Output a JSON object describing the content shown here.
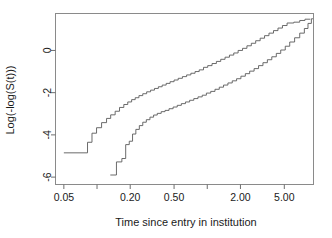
{
  "chart_data": {
    "type": "line",
    "title": "",
    "subtitle": "",
    "xlabel": "Time since entry in institution",
    "ylabel": "Log(-log(S(t)))",
    "xscale": "log",
    "yscale": "linear",
    "grid": false,
    "legend": null,
    "xlim": [
      0.042,
      9.2
    ],
    "ylim": [
      -6.35,
      1.75
    ],
    "x_ticks": [
      0.05,
      0.1,
      0.2,
      0.5,
      1.0,
      2.0,
      5.0
    ],
    "x_tick_labels": [
      "0.05",
      "",
      "0.20",
      "0.50",
      "",
      "2.00",
      "5.00"
    ],
    "x_minor_ticks": [
      0.05,
      0.1,
      0.2,
      0.5,
      1.0,
      2.0,
      5.0
    ],
    "y_ticks": [
      0,
      -2,
      -4,
      -6
    ],
    "y_tick_labels": [
      "0",
      "-2",
      "-4",
      "-6"
    ],
    "series": [
      {
        "name": "upper-curve",
        "style": "step",
        "points": [
          [
            0.05,
            -4.85
          ],
          [
            0.082,
            -4.85
          ],
          [
            0.082,
            -4.35
          ],
          [
            0.09,
            -4.35
          ],
          [
            0.09,
            -3.92
          ],
          [
            0.099,
            -3.92
          ],
          [
            0.099,
            -3.66
          ],
          [
            0.11,
            -3.66
          ],
          [
            0.11,
            -3.42
          ],
          [
            0.122,
            -3.42
          ],
          [
            0.122,
            -3.22
          ],
          [
            0.133,
            -3.22
          ],
          [
            0.133,
            -3.05
          ],
          [
            0.146,
            -3.05
          ],
          [
            0.146,
            -2.88
          ],
          [
            0.16,
            -2.88
          ],
          [
            0.16,
            -2.7
          ],
          [
            0.175,
            -2.7
          ],
          [
            0.175,
            -2.56
          ],
          [
            0.19,
            -2.56
          ],
          [
            0.19,
            -2.44
          ],
          [
            0.206,
            -2.44
          ],
          [
            0.206,
            -2.33
          ],
          [
            0.222,
            -2.33
          ],
          [
            0.222,
            -2.24
          ],
          [
            0.24,
            -2.24
          ],
          [
            0.24,
            -2.14
          ],
          [
            0.26,
            -2.14
          ],
          [
            0.26,
            -2.05
          ],
          [
            0.282,
            -2.05
          ],
          [
            0.282,
            -1.96
          ],
          [
            0.306,
            -1.96
          ],
          [
            0.306,
            -1.88
          ],
          [
            0.332,
            -1.88
          ],
          [
            0.332,
            -1.8
          ],
          [
            0.36,
            -1.8
          ],
          [
            0.36,
            -1.72
          ],
          [
            0.39,
            -1.72
          ],
          [
            0.39,
            -1.64
          ],
          [
            0.424,
            -1.64
          ],
          [
            0.424,
            -1.56
          ],
          [
            0.46,
            -1.56
          ],
          [
            0.46,
            -1.48
          ],
          [
            0.5,
            -1.48
          ],
          [
            0.5,
            -1.4
          ],
          [
            0.545,
            -1.4
          ],
          [
            0.545,
            -1.32
          ],
          [
            0.595,
            -1.32
          ],
          [
            0.595,
            -1.24
          ],
          [
            0.65,
            -1.24
          ],
          [
            0.65,
            -1.16
          ],
          [
            0.71,
            -1.16
          ],
          [
            0.71,
            -1.08
          ],
          [
            0.775,
            -1.08
          ],
          [
            0.775,
            -1.0
          ],
          [
            0.845,
            -1.0
          ],
          [
            0.845,
            -0.92
          ],
          [
            0.925,
            -0.92
          ],
          [
            0.925,
            -0.8
          ],
          [
            1.01,
            -0.8
          ],
          [
            1.01,
            -0.72
          ],
          [
            1.105,
            -0.72
          ],
          [
            1.105,
            -0.62
          ],
          [
            1.21,
            -0.62
          ],
          [
            1.21,
            -0.52
          ],
          [
            1.325,
            -0.52
          ],
          [
            1.325,
            -0.42
          ],
          [
            1.45,
            -0.42
          ],
          [
            1.45,
            -0.32
          ],
          [
            1.59,
            -0.32
          ],
          [
            1.59,
            -0.22
          ],
          [
            1.74,
            -0.22
          ],
          [
            1.74,
            -0.12
          ],
          [
            1.905,
            -0.12
          ],
          [
            1.905,
            0.0
          ],
          [
            2.09,
            0.0
          ],
          [
            2.09,
            0.1
          ],
          [
            2.29,
            0.1
          ],
          [
            2.29,
            0.22
          ],
          [
            2.51,
            0.22
          ],
          [
            2.51,
            0.34
          ],
          [
            2.75,
            0.34
          ],
          [
            2.75,
            0.46
          ],
          [
            3.02,
            0.46
          ],
          [
            3.02,
            0.58
          ],
          [
            3.31,
            0.58
          ],
          [
            3.31,
            0.7
          ],
          [
            3.63,
            0.7
          ],
          [
            3.63,
            0.82
          ],
          [
            3.99,
            0.82
          ],
          [
            3.99,
            0.94
          ],
          [
            4.38,
            0.94
          ],
          [
            4.38,
            1.06
          ],
          [
            4.81,
            1.06
          ],
          [
            4.81,
            1.18
          ],
          [
            5.3,
            1.18
          ],
          [
            5.3,
            1.3
          ],
          [
            6.1,
            1.3
          ],
          [
            6.1,
            1.34
          ],
          [
            6.9,
            1.34
          ],
          [
            6.9,
            1.42
          ],
          [
            7.7,
            1.42
          ],
          [
            7.7,
            1.48
          ],
          [
            8.6,
            1.48
          ]
        ]
      },
      {
        "name": "lower-curve",
        "style": "step",
        "points": [
          [
            0.132,
            -5.9
          ],
          [
            0.15,
            -5.9
          ],
          [
            0.15,
            -5.28
          ],
          [
            0.168,
            -5.28
          ],
          [
            0.168,
            -5.12
          ],
          [
            0.182,
            -5.12
          ],
          [
            0.182,
            -4.46
          ],
          [
            0.196,
            -4.46
          ],
          [
            0.196,
            -4.3
          ],
          [
            0.21,
            -4.3
          ],
          [
            0.21,
            -3.96
          ],
          [
            0.225,
            -3.96
          ],
          [
            0.225,
            -3.74
          ],
          [
            0.242,
            -3.74
          ],
          [
            0.242,
            -3.56
          ],
          [
            0.26,
            -3.56
          ],
          [
            0.26,
            -3.4
          ],
          [
            0.28,
            -3.4
          ],
          [
            0.28,
            -3.28
          ],
          [
            0.302,
            -3.28
          ],
          [
            0.302,
            -3.16
          ],
          [
            0.326,
            -3.16
          ],
          [
            0.326,
            -3.06
          ],
          [
            0.352,
            -3.06
          ],
          [
            0.352,
            -2.98
          ],
          [
            0.382,
            -2.98
          ],
          [
            0.382,
            -2.9
          ],
          [
            0.414,
            -2.9
          ],
          [
            0.414,
            -2.84
          ],
          [
            0.45,
            -2.84
          ],
          [
            0.45,
            -2.76
          ],
          [
            0.49,
            -2.76
          ],
          [
            0.49,
            -2.68
          ],
          [
            0.534,
            -2.68
          ],
          [
            0.534,
            -2.6
          ],
          [
            0.582,
            -2.6
          ],
          [
            0.582,
            -2.52
          ],
          [
            0.634,
            -2.52
          ],
          [
            0.634,
            -2.44
          ],
          [
            0.692,
            -2.44
          ],
          [
            0.692,
            -2.36
          ],
          [
            0.755,
            -2.36
          ],
          [
            0.755,
            -2.28
          ],
          [
            0.824,
            -2.28
          ],
          [
            0.824,
            -2.2
          ],
          [
            0.9,
            -2.2
          ],
          [
            0.9,
            -2.12
          ],
          [
            0.982,
            -2.12
          ],
          [
            0.982,
            -2.02
          ],
          [
            1.075,
            -2.02
          ],
          [
            1.075,
            -1.94
          ],
          [
            1.175,
            -1.94
          ],
          [
            1.175,
            -1.84
          ],
          [
            1.285,
            -1.84
          ],
          [
            1.285,
            -1.74
          ],
          [
            1.405,
            -1.74
          ],
          [
            1.405,
            -1.64
          ],
          [
            1.54,
            -1.64
          ],
          [
            1.54,
            -1.54
          ],
          [
            1.685,
            -1.54
          ],
          [
            1.685,
            -1.44
          ],
          [
            1.845,
            -1.44
          ],
          [
            1.845,
            -1.34
          ],
          [
            2.02,
            -1.34
          ],
          [
            2.02,
            -1.22
          ],
          [
            2.215,
            -1.22
          ],
          [
            2.215,
            -1.1
          ],
          [
            2.425,
            -1.1
          ],
          [
            2.425,
            -0.98
          ],
          [
            2.66,
            -0.98
          ],
          [
            2.66,
            -0.86
          ],
          [
            2.92,
            -0.86
          ],
          [
            2.92,
            -0.72
          ],
          [
            3.2,
            -0.72
          ],
          [
            3.2,
            -0.58
          ],
          [
            3.51,
            -0.58
          ],
          [
            3.51,
            -0.44
          ],
          [
            3.85,
            -0.44
          ],
          [
            3.85,
            -0.3
          ],
          [
            4.23,
            -0.3
          ],
          [
            4.23,
            -0.14
          ],
          [
            4.64,
            -0.14
          ],
          [
            4.64,
            0.02
          ],
          [
            5.1,
            0.02
          ],
          [
            5.1,
            0.2
          ],
          [
            5.6,
            0.2
          ],
          [
            5.6,
            0.4
          ],
          [
            6.2,
            0.4
          ],
          [
            6.2,
            0.6
          ],
          [
            6.9,
            0.6
          ],
          [
            6.9,
            0.82
          ],
          [
            7.6,
            0.82
          ],
          [
            7.6,
            1.04
          ],
          [
            8.2,
            1.04
          ],
          [
            8.2,
            1.28
          ],
          [
            8.8,
            1.28
          ],
          [
            8.8,
            1.5
          ],
          [
            9.1,
            1.5
          ]
        ]
      }
    ],
    "colors": {
      "curve": "#5a5a5a",
      "axis": "#6e6e6e",
      "text": "#1a1a1a",
      "background": "#ffffff"
    }
  }
}
